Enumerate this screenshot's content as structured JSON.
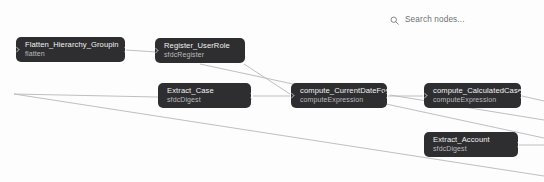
{
  "app": {
    "canvas_background": "#fdfdfd",
    "node_color": "#2e2e30",
    "node_title_color": "#f2f2f3",
    "node_subtitle_color": "#b9babd",
    "edge_color": "#b7b8ba"
  },
  "search": {
    "icon": "search-icon",
    "placeholder": "Search nodes...",
    "value": ""
  },
  "graph": {
    "nodes": [
      {
        "id": "flatten-hierarchy-groupin",
        "title": "Flatten_Hierarchy_Groupin",
        "subtitle": "flatten",
        "x": 16,
        "y": 37,
        "width": 109,
        "height": 25,
        "has_input": true,
        "has_output": true
      },
      {
        "id": "register-userrole",
        "title": "Register_UserRole",
        "subtitle": "sfdcRegister",
        "x": 155,
        "y": 38,
        "width": 90,
        "height": 25,
        "has_input": true,
        "has_output": false
      },
      {
        "id": "extract-case",
        "title": "Extract_Case",
        "subtitle": "sfdcDigest",
        "x": 158,
        "y": 83,
        "width": 93,
        "height": 25,
        "has_input": false,
        "has_output": true
      },
      {
        "id": "compute-currentdateforc",
        "title": "compute_CurrentDateForC",
        "subtitle": "computeExpression",
        "x": 291,
        "y": 83,
        "width": 96,
        "height": 25,
        "has_input": true,
        "has_output": true
      },
      {
        "id": "compute-calculatedcased",
        "title": "compute_CalculatedCaseD",
        "subtitle": "computeExpression",
        "x": 424,
        "y": 83,
        "width": 97,
        "height": 25,
        "has_input": true,
        "has_output": true
      },
      {
        "id": "extract-account",
        "title": "Extract_Account",
        "subtitle": "sfdcDigest",
        "x": 424,
        "y": 132,
        "width": 94,
        "height": 25,
        "has_input": false,
        "has_output": true
      }
    ],
    "edges": [
      {
        "id": "edge-flatten-to-register",
        "d": "M 126 50 L 156 52"
      },
      {
        "id": "edge-register-crossing",
        "d": "M 200 64 L 544 138"
      },
      {
        "id": "edge-longdiagonal-left",
        "d": "M 14 94 L 252 99"
      },
      {
        "id": "edge-longdiagonal-far",
        "d": "M 14 94 L 544 176"
      },
      {
        "id": "edge-extractcase-to-compute",
        "d": "M 253 96 L 290 96"
      },
      {
        "id": "edge-compute-to-calculated",
        "d": "M 388 96 L 423 96"
      },
      {
        "id": "edge-upper-into-compute",
        "d": "M 244 64 L 290 94"
      },
      {
        "id": "edge-calculated-out-a",
        "d": "M 522 96 L 544 101"
      },
      {
        "id": "edge-calculated-out-b",
        "d": "M 390 95 L 544 120"
      },
      {
        "id": "edge-account-out",
        "d": "M 519 145 L 544 145"
      }
    ]
  }
}
